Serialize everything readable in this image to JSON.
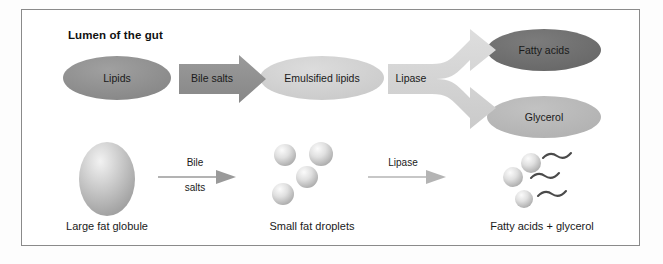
{
  "figure": {
    "title": "Lumen of the gut",
    "frame_border_color": "#8a8a8a",
    "background_color": "#ffffff"
  },
  "top_row": {
    "nodes": [
      {
        "id": "lipids",
        "label": "Lipids",
        "shape": "ellipse",
        "fill": "#8e8e8e"
      },
      {
        "id": "emulsified-lipids",
        "label": "Emulsified lipids",
        "shape": "ellipse",
        "fill": "#d2d2d2"
      },
      {
        "id": "fatty-acids",
        "label": "Fatty acids",
        "shape": "ellipse",
        "fill": "#6e6e6e"
      },
      {
        "id": "glycerol",
        "label": "Glycerol",
        "shape": "ellipse",
        "fill": "#b8b8b8"
      }
    ],
    "arrows": [
      {
        "id": "bile-salts-arrow",
        "label": "Bile salts",
        "style": "block",
        "fill": "#8f8f8f"
      },
      {
        "id": "lipase-arrow",
        "label": "Lipase",
        "style": "forked",
        "fill": "#d4d4d4"
      }
    ]
  },
  "bottom_row": {
    "nodes": [
      {
        "id": "large-fat-globule",
        "caption": "Large fat globule",
        "shape": "globule"
      },
      {
        "id": "small-fat-droplets",
        "caption": "Small fat droplets",
        "shape": "droplets",
        "count": 4
      },
      {
        "id": "fatty-acids-glycerol",
        "caption": "Fatty acids + glycerol",
        "shape": "droplets-with-tails",
        "count": 3
      }
    ],
    "arrows": [
      {
        "id": "bile-salts-thin-arrow",
        "label_top": "Bile",
        "label_bottom": "salts",
        "style": "thin",
        "color": "#9a9a9a"
      },
      {
        "id": "lipase-thin-arrow",
        "label_top": "Lipase",
        "label_bottom": "",
        "style": "thin",
        "color": "#b4b4b4"
      }
    ]
  },
  "colors": {
    "dark_gray": "#6e6e6e",
    "mid_gray": "#8e8e8e",
    "light_gray": "#d2d2d2",
    "pale_gray": "#b8b8b8",
    "text": "#1a1a1a",
    "frame": "#8a8a8a"
  }
}
